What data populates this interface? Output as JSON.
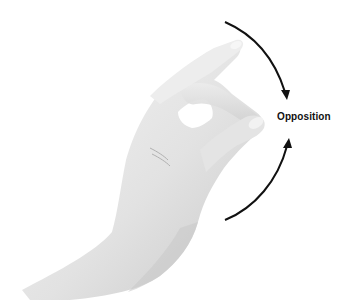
{
  "figure": {
    "label": "Opposition",
    "colors": {
      "background": "#ffffff",
      "skin_light": "#eeeeee",
      "skin_mid": "#d6d6d6",
      "skin_shadow": "#b5b5b5",
      "arrow": "#111111"
    }
  }
}
